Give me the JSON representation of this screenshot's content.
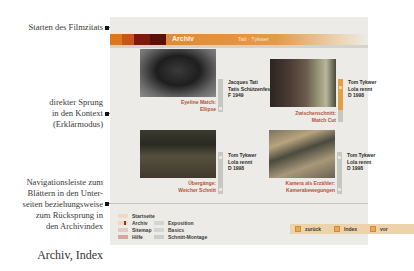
{
  "annotations": {
    "start_film_quote": "Starten des Filmzitats",
    "direct_jump": [
      "direkter Sprung",
      "in den Kontext",
      "(Erklärmodus)"
    ],
    "navigation_bar": [
      "Navigationsleiste zum",
      "Blättern in den Unter-",
      "seiten beziehungsweise",
      "zum Rücksprung in",
      "den Archivindex"
    ],
    "figure_caption": "Archiv, Index"
  },
  "header": {
    "title": "Archiv",
    "subtitle": "Tati · Tykwer",
    "colors": [
      "#d9781e",
      "#c4561a",
      "#7c1a0b",
      "#5b0f07"
    ]
  },
  "tiles": [
    {
      "caption": [
        "Eyeline Match:",
        "Ellipse"
      ],
      "info": [
        "Jacques Tati",
        "Tatis Schützenfest",
        "F 1949"
      ],
      "accent": "#c7c7c2"
    },
    {
      "caption": [
        "Zwischenschnitt:",
        "Match Cut"
      ],
      "info": [
        "Tom Tykwer",
        "Lola rennt",
        "D 1998"
      ],
      "accent": "#e2a044"
    },
    {
      "caption": [
        "Übergänge:",
        "Weicher Schnitt"
      ],
      "info": [
        "Tom Tykwer",
        "Lola rennt",
        "D 1998"
      ],
      "accent": "#c7c7c2"
    },
    {
      "caption": [
        "Kamera als Erzähler:",
        "Kamerabewegungen"
      ],
      "info": [
        "Tom Tykwer",
        "Lola rennt",
        "D 1998"
      ],
      "accent": "#c7c7c2"
    }
  ],
  "menu": {
    "col1": [
      {
        "label": "Startseite",
        "color": "#efd9c4"
      },
      {
        "label": "Archiv",
        "color": "#c98a5a",
        "active": true
      },
      {
        "label": "Sitemap",
        "color": "#e2c9c2"
      },
      {
        "label": "Hilfe",
        "color": "#cfa9a4"
      }
    ],
    "col2": [
      {
        "label": "Exposition",
        "color": "#d2d6d0"
      },
      {
        "label": "Basics",
        "color": "#d2d6d0"
      },
      {
        "label": "Schnitt-Montage",
        "color": "#c9d0cc"
      }
    ]
  },
  "nav": {
    "back": "zurück",
    "index": "Index",
    "forward": "vor"
  }
}
